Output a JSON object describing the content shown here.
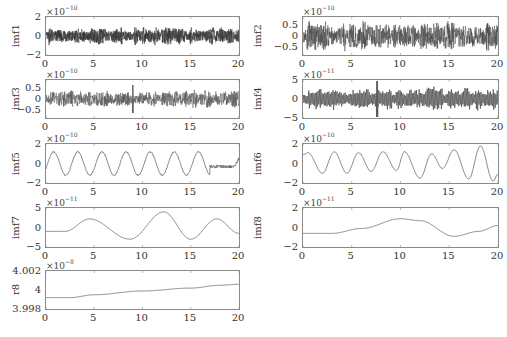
{
  "chart_data": [
    {
      "type": "line",
      "ylabel": "imf1",
      "exponent_label": "×10",
      "exponent": "-10",
      "xlim": [
        0,
        20
      ],
      "ylim": [
        -2,
        2
      ],
      "xticks": [
        "0",
        "5",
        "10",
        "15",
        "20"
      ],
      "yticks": [
        "2",
        "0",
        "-2"
      ],
      "signal": {
        "kind": "noise",
        "amplitude": 0.8,
        "frequency": "very high",
        "color": "#333333"
      }
    },
    {
      "type": "line",
      "ylabel": "imf2",
      "exponent_label": "×10",
      "exponent": "-10",
      "xlim": [
        0,
        20
      ],
      "ylim": [
        -0.9,
        0.9
      ],
      "xticks": [
        "0",
        "5",
        "10",
        "15",
        "20"
      ],
      "yticks": [
        "0.5",
        "0",
        "-0.5"
      ],
      "signal": {
        "kind": "noise",
        "amplitude": 0.6,
        "frequency": "high",
        "color": "#444444"
      }
    },
    {
      "type": "line",
      "ylabel": "imf3",
      "exponent_label": "×10",
      "exponent": "-10",
      "xlim": [
        0,
        20
      ],
      "ylim": [
        -0.9,
        0.9
      ],
      "xticks": [
        "0",
        "5",
        "10",
        "15",
        "20"
      ],
      "yticks": [
        "0.5",
        "0",
        "-0.5"
      ],
      "signal": {
        "kind": "noise",
        "amplitude": 0.35,
        "frequency": "high",
        "spike_at_x": 9,
        "color": "#555555"
      }
    },
    {
      "type": "line",
      "ylabel": "imf4",
      "exponent_label": "×10",
      "exponent": "-11",
      "xlim": [
        0,
        20
      ],
      "ylim": [
        -5,
        5
      ],
      "xticks": [
        "0",
        "5",
        "10",
        "15",
        "20"
      ],
      "yticks": [
        "5",
        "0",
        "-5"
      ],
      "signal": {
        "kind": "oscillation",
        "amplitude": 2.5,
        "frequency": "medium-high",
        "spike_at_x": 7.6,
        "color": "#555555"
      }
    },
    {
      "type": "line",
      "ylabel": "imf5",
      "exponent_label": "×10",
      "exponent": "-10",
      "xlim": [
        0,
        20
      ],
      "ylim": [
        -2,
        2
      ],
      "xticks": [
        "0",
        "5",
        "10",
        "15",
        "20"
      ],
      "yticks": [
        "2",
        "0",
        "-2"
      ],
      "peaks_x": [
        0.8,
        3.3,
        5.7,
        8.2,
        10.7,
        13.2,
        15.7
      ],
      "troughs_x": [
        2.0,
        4.5,
        7.0,
        9.5,
        12.0,
        14.5,
        17.0
      ],
      "signal": {
        "kind": "sine",
        "amplitude": 1.2,
        "period": 2.5,
        "tail": "small flat wiggles 17-20",
        "color": "#666666"
      }
    },
    {
      "type": "line",
      "ylabel": "imf6",
      "exponent_label": "×10",
      "exponent": "-10",
      "xlim": [
        0,
        20
      ],
      "ylim": [
        -2,
        2
      ],
      "xticks": [
        "0",
        "5",
        "10",
        "15",
        "20"
      ],
      "yticks": [
        "2",
        "0",
        "-2"
      ],
      "peaks": [
        [
          0.5,
          1.1
        ],
        [
          3.2,
          1.2
        ],
        [
          5.7,
          1.1
        ],
        [
          8.2,
          1.2
        ],
        [
          10.4,
          1.2
        ],
        [
          13.2,
          1.0
        ],
        [
          15.5,
          1.4
        ],
        [
          18.2,
          1.8
        ]
      ],
      "troughs": [
        [
          2.0,
          -1.0
        ],
        [
          4.5,
          -1.0
        ],
        [
          7.0,
          -0.8
        ],
        [
          9.6,
          -0.7
        ],
        [
          12.0,
          -1.5
        ],
        [
          14.3,
          -0.5
        ],
        [
          17.0,
          -1.6
        ],
        [
          19.5,
          -1.8
        ]
      ],
      "signal": {
        "kind": "sine",
        "color": "#666666"
      }
    },
    {
      "type": "line",
      "ylabel": "imf7",
      "exponent_label": "×10",
      "exponent": "-11",
      "xlim": [
        0,
        20
      ],
      "ylim": [
        -5,
        5
      ],
      "xticks": [
        "0",
        "5",
        "10",
        "15",
        "20"
      ],
      "yticks": [
        "5",
        "0",
        "-5"
      ],
      "x": [
        0,
        2,
        4.5,
        8.7,
        12.2,
        15,
        17.7,
        20
      ],
      "y": [
        -1.0,
        -1.0,
        2.2,
        -3.0,
        4.0,
        -3.0,
        2.2,
        -1.5
      ],
      "signal": {
        "kind": "smooth",
        "color": "#666666"
      }
    },
    {
      "type": "line",
      "ylabel": "imf8",
      "exponent_label": "×10",
      "exponent": "-11",
      "xlim": [
        0,
        20
      ],
      "ylim": [
        -2,
        2
      ],
      "xticks": [
        "0",
        "5",
        "10",
        "15",
        "20"
      ],
      "yticks": [
        "2",
        "0",
        "-2"
      ],
      "x": [
        0,
        3,
        6,
        10,
        12,
        15.5,
        18,
        20
      ],
      "y": [
        -0.6,
        -0.6,
        -0.1,
        0.9,
        0.7,
        -0.9,
        -0.4,
        0.2
      ],
      "signal": {
        "kind": "smooth",
        "color": "#666666"
      }
    },
    {
      "type": "line",
      "ylabel": "r8",
      "exponent_label": "×10",
      "exponent": "-8",
      "xlim": [
        0,
        20
      ],
      "ylim": [
        3.998,
        4.002
      ],
      "xticks": [
        "0",
        "5",
        "10",
        "15",
        "20"
      ],
      "yticks": [
        "4.002",
        "4",
        "3.998"
      ],
      "x": [
        0,
        2.5,
        5,
        10,
        15,
        18,
        20
      ],
      "y": [
        3.9992,
        3.9992,
        3.9995,
        3.9999,
        4.0002,
        4.0005,
        4.0006
      ],
      "signal": {
        "kind": "trend",
        "color": "#666666"
      }
    }
  ],
  "caption": {
    "text": "",
    "visible": "clipped"
  }
}
